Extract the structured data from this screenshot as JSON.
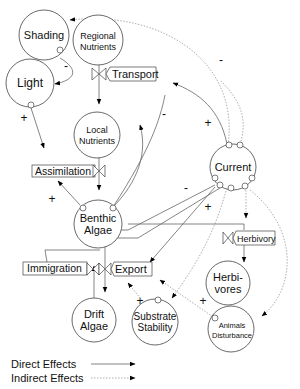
{
  "diagram": {
    "nodes": {
      "shading": "Shading",
      "regional_nutrients_1": "Regional",
      "regional_nutrients_2": "Nutrients",
      "light": "Light",
      "local_nutrients_1": "Local",
      "local_nutrients_2": "Nutrients",
      "benthic_algae_1": "Benthic",
      "benthic_algae_2": "Algae",
      "current": "Current",
      "drift_algae_1": "Drift",
      "drift_algae_2": "Algae",
      "herbivores_1": "Herbi-",
      "herbivores_2": "vores",
      "substrate_stability_1": "Substrate",
      "substrate_stability_2": "Stability",
      "animals_disturbance_1": "Animals",
      "animals_disturbance_2": "Disturbance"
    },
    "processes": {
      "transport": "Transport",
      "assimilation": "Assimilation",
      "herbivory": "Herbivory",
      "immigration": "Immigration",
      "export": "Export"
    },
    "signs": {
      "shading_light": "-",
      "light_assimilation": "+",
      "benthic_assimilation": "+",
      "current_shading": "-",
      "current_transport_plus": "+",
      "current_transport_minus": "-",
      "current_export_minus": "-",
      "current_export_plus": "+",
      "substrate_export": "+",
      "animals_export": "+"
    }
  },
  "legend": {
    "direct": "Direct Effects",
    "indirect": "Indirect Effects"
  },
  "colors": {
    "line": "#555555",
    "dotted": "#888888",
    "arrow": "#000000"
  }
}
